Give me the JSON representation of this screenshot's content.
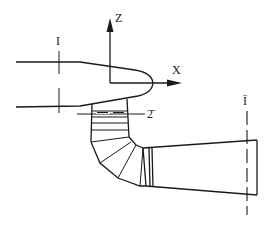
{
  "diagram": {
    "title": "",
    "axes": {
      "z_label": "Z",
      "x_label": "X"
    },
    "sections": {
      "inlet_label": "I",
      "outlet_label": "Ī",
      "mid_label": "2̄"
    },
    "colors": {
      "line": "#1a1a1a",
      "background": "#ffffff"
    }
  }
}
